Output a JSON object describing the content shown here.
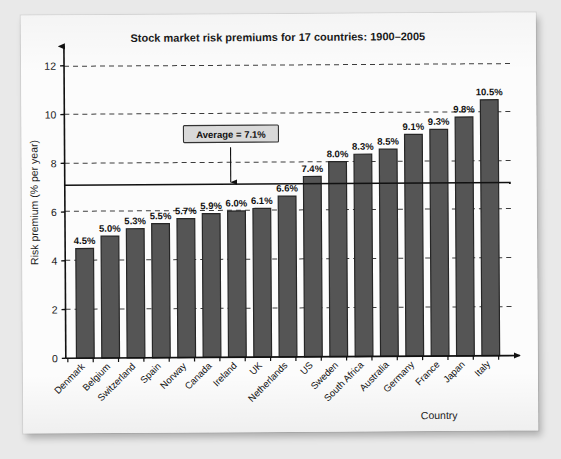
{
  "scan": {
    "edge_artifact_text": "S 11.02   12 of 14"
  },
  "chart_data": {
    "type": "bar",
    "title": "Stock market risk premiums for 17 countries: 1900–2005",
    "xlabel": "Country",
    "ylabel": "Risk premium (% per year)",
    "ylim": [
      0,
      12.8
    ],
    "yticks": [
      0,
      2,
      4,
      6,
      8,
      10,
      12
    ],
    "ytick_labels": [
      "0",
      "2",
      "4",
      "6",
      "8",
      "10",
      "12"
    ],
    "grid": "horizontal-dashed",
    "legend": "none",
    "categories": [
      "Denmark",
      "Belgium",
      "Switzerland",
      "Spain",
      "Norway",
      "Canada",
      "Ireland",
      "UK",
      "Netherlands",
      "US",
      "Sweden",
      "South Africa",
      "Australia",
      "Germany",
      "France",
      "Japan",
      "Italy"
    ],
    "values": [
      4.5,
      5.0,
      5.3,
      5.5,
      5.7,
      5.9,
      6.0,
      6.1,
      6.6,
      7.4,
      8.0,
      8.3,
      8.5,
      9.1,
      9.3,
      9.8,
      10.5
    ],
    "value_labels": [
      "4.5%",
      "5.0%",
      "5.3%",
      "5.5%",
      "5.7%",
      "5.9%",
      "6.0%",
      "6.1%",
      "6.6%",
      "7.4%",
      "8.0%",
      "8.3%",
      "8.5%",
      "9.1%",
      "9.3%",
      "9.8%",
      "10.5%"
    ],
    "annotations": [
      {
        "name": "average-line",
        "label": "Average = 7.1%",
        "value": 7.1,
        "style": "solid-line-with-arrow-callout"
      }
    ],
    "colors": {
      "bar_fill": "#555555",
      "bar_stroke": "#262626",
      "axis": "#111111",
      "gridline": "#444444",
      "average_line": "#111111",
      "callout_box_fill": "#d9d9d9",
      "callout_box_stroke": "#333333",
      "page_background": "#fcfcfc"
    }
  }
}
